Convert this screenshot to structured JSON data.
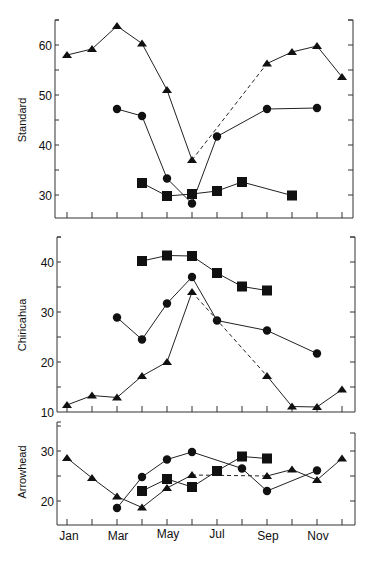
{
  "chart_data": [
    {
      "type": "line",
      "panel": "Standard",
      "ylabel": "Standard",
      "ylim": [
        25,
        65
      ],
      "yticks": [
        30,
        40,
        50,
        60
      ],
      "x": [
        "Jan",
        "Feb",
        "Mar",
        "Apr",
        "May",
        "Jun",
        "Jul",
        "Aug",
        "Sep",
        "Oct",
        "Nov",
        "Dec"
      ],
      "series": [
        {
          "name": "triangle",
          "marker": "triangle",
          "values": [
            58.0,
            59.2,
            63.8,
            60.3,
            51.0,
            37.0,
            null,
            null,
            56.3,
            58.6,
            59.8,
            53.6
          ],
          "dashed_gap": [
            "Jun",
            "Sep"
          ]
        },
        {
          "name": "circle",
          "marker": "circle",
          "values": [
            null,
            null,
            47.2,
            45.8,
            33.3,
            28.3,
            41.7,
            null,
            47.2,
            null,
            47.4,
            null
          ]
        },
        {
          "name": "square",
          "marker": "square",
          "values": [
            null,
            null,
            null,
            32.4,
            29.8,
            30.2,
            30.8,
            32.6,
            null,
            29.9,
            null,
            null
          ]
        }
      ]
    },
    {
      "type": "line",
      "panel": "Chiricahua",
      "ylabel": "Chiricahua",
      "ylim": [
        10,
        45
      ],
      "yticks": [
        10,
        20,
        30,
        40
      ],
      "x": [
        "Jan",
        "Feb",
        "Mar",
        "Apr",
        "May",
        "Jun",
        "Jul",
        "Aug",
        "Sep",
        "Oct",
        "Nov",
        "Dec"
      ],
      "series": [
        {
          "name": "square",
          "marker": "square",
          "values": [
            null,
            null,
            null,
            40.2,
            41.3,
            41.2,
            37.8,
            35.1,
            34.3,
            null,
            null,
            null
          ]
        },
        {
          "name": "circle",
          "marker": "circle",
          "values": [
            null,
            null,
            28.9,
            24.5,
            31.7,
            37.0,
            28.3,
            null,
            26.3,
            null,
            21.7,
            null
          ]
        },
        {
          "name": "triangle",
          "marker": "triangle",
          "values": [
            11.4,
            13.3,
            12.9,
            17.2,
            20.0,
            34.0,
            null,
            null,
            17.2,
            11.1,
            11.0,
            14.5
          ],
          "dashed_gap": [
            "Jun",
            "Sep"
          ]
        }
      ]
    },
    {
      "type": "line",
      "panel": "Arrowhead",
      "ylabel": "Arrowhead",
      "ylim": [
        15,
        35
      ],
      "yticks": [
        20,
        30
      ],
      "x": [
        "Jan",
        "Feb",
        "Mar",
        "Apr",
        "May",
        "Jun",
        "Jul",
        "Aug",
        "Sep",
        "Oct",
        "Nov",
        "Dec"
      ],
      "xtick_labels": [
        "Jan",
        "Mar",
        "May",
        "Jul",
        "Sep",
        "Nov"
      ],
      "series": [
        {
          "name": "triangle",
          "marker": "triangle",
          "values": [
            28.6,
            24.6,
            20.9,
            18.7,
            22.6,
            25.2,
            null,
            null,
            25.0,
            26.3,
            24.2,
            28.5
          ],
          "dashed_gap": [
            "Jun",
            "Sep"
          ]
        },
        {
          "name": "circle",
          "marker": "circle",
          "values": [
            null,
            null,
            18.6,
            24.8,
            28.3,
            29.8,
            null,
            26.5,
            22.0,
            null,
            26.1,
            null
          ]
        },
        {
          "name": "square",
          "marker": "square",
          "values": [
            null,
            null,
            null,
            22.0,
            24.4,
            22.8,
            26.0,
            28.9,
            28.5,
            null,
            null,
            null
          ]
        }
      ]
    }
  ],
  "labels": {
    "panel1_ylabel": "Standard",
    "panel2_ylabel": "Chiricahua",
    "panel3_ylabel": "Arrowhead",
    "months": [
      "Jan",
      "Mar",
      "May",
      "Jul",
      "Sep",
      "Nov"
    ]
  },
  "colors": {
    "line": "#222222",
    "axis": "#333333",
    "background": "#ffffff"
  }
}
